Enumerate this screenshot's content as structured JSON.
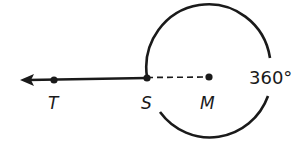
{
  "diagram": {
    "type": "geometry-rotation",
    "stroke_color": "#1a1a1a",
    "background": "#ffffff",
    "points": [
      {
        "id": "T",
        "label": "T"
      },
      {
        "id": "S",
        "label": "S"
      },
      {
        "id": "M",
        "label": "M"
      }
    ],
    "ray": {
      "from": "S",
      "through": "T",
      "arrow": true
    },
    "segment": {
      "from": "S",
      "to": "M",
      "style": "dashed"
    },
    "arc": {
      "center": "M",
      "label": "360°"
    }
  }
}
